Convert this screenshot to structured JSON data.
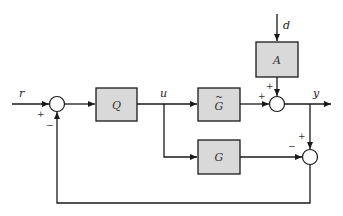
{
  "diagram": {
    "type": "block-diagram",
    "title": "",
    "colors": {
      "block_fill": "#d9d9d9",
      "stroke": "#1a1a1a",
      "background": "#ffffff"
    },
    "signals": {
      "r": "r",
      "u": "u",
      "y": "y",
      "d": "d"
    },
    "blocks": {
      "Q": "Q",
      "G_tilde": "G",
      "G_tilde_accent": "~",
      "A": "A",
      "G": "G"
    },
    "summing_junctions": {
      "input": {
        "signs": [
          "+",
          "−"
        ]
      },
      "output": {
        "signs": [
          "+",
          "+"
        ]
      },
      "model_error": {
        "signs": [
          "+",
          "−"
        ]
      }
    }
  }
}
